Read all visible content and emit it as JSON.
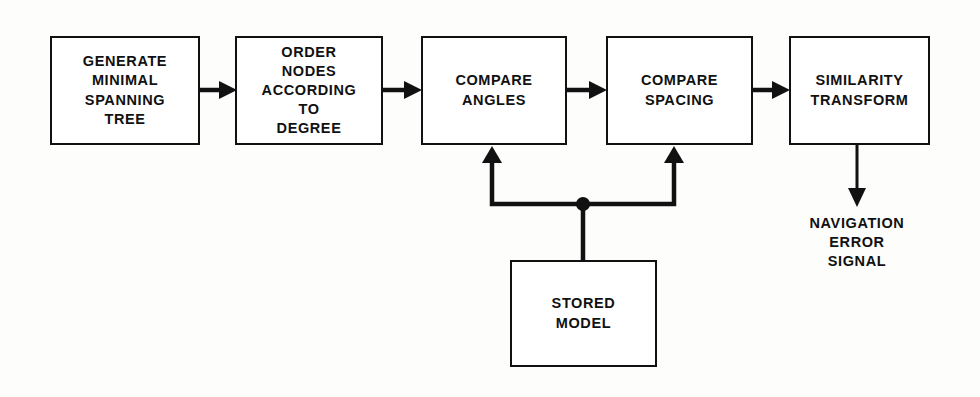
{
  "diagram": {
    "type": "flowchart",
    "orientation": "left-to-right",
    "background_color": "#fdfdfc",
    "stroke_color": "#111111",
    "nodes": [
      {
        "id": "generate-minimal-spanning-tree",
        "label": "GENERATE\nMINIMAL\nSPANNING\nTREE",
        "shape": "rectangle",
        "x": 50,
        "y": 36,
        "w": 150,
        "h": 109
      },
      {
        "id": "order-nodes-according-to-degree",
        "label": "ORDER\nNODES\nACCORDING\nTO\nDEGREE",
        "shape": "rectangle",
        "x": 235,
        "y": 36,
        "w": 148,
        "h": 109
      },
      {
        "id": "compare-angles",
        "label": "COMPARE\nANGLES",
        "shape": "rectangle",
        "x": 421,
        "y": 36,
        "w": 146,
        "h": 109
      },
      {
        "id": "compare-spacing",
        "label": "COMPARE\nSPACING",
        "shape": "rectangle",
        "x": 606,
        "y": 36,
        "w": 147,
        "h": 109
      },
      {
        "id": "similarity-transform",
        "label": "SIMILARITY\nTRANSFORM",
        "shape": "rectangle",
        "x": 789,
        "y": 36,
        "w": 141,
        "h": 109
      },
      {
        "id": "stored-model",
        "label": "STORED\nMODEL",
        "shape": "rectangle",
        "x": 510,
        "y": 260,
        "w": 147,
        "h": 107
      }
    ],
    "captions": [
      {
        "id": "navigation-error-signal",
        "label": "NAVIGATION\nERROR\nSIGNAL",
        "x": 857,
        "y": 214
      }
    ],
    "edges": [
      {
        "id": "edge-mst-to-order",
        "from": "generate-minimal-spanning-tree",
        "to": "order-nodes-according-to-degree",
        "style": "arrow"
      },
      {
        "id": "edge-order-to-angles",
        "from": "order-nodes-according-to-degree",
        "to": "compare-angles",
        "style": "arrow"
      },
      {
        "id": "edge-angles-to-spacing",
        "from": "compare-angles",
        "to": "compare-spacing",
        "style": "arrow"
      },
      {
        "id": "edge-spacing-to-similarity",
        "from": "compare-spacing",
        "to": "similarity-transform",
        "style": "arrow"
      },
      {
        "id": "edge-similarity-to-output",
        "from": "similarity-transform",
        "to": "navigation-error-signal",
        "style": "arrow"
      },
      {
        "id": "edge-model-to-angles",
        "from": "stored-model",
        "to": "compare-angles",
        "style": "arrow-branch"
      },
      {
        "id": "edge-model-to-spacing",
        "from": "stored-model",
        "to": "compare-spacing",
        "style": "arrow-branch"
      }
    ],
    "junctions": [
      {
        "id": "stored-model-junction",
        "x": 583,
        "y": 204,
        "r": 7
      }
    ]
  }
}
